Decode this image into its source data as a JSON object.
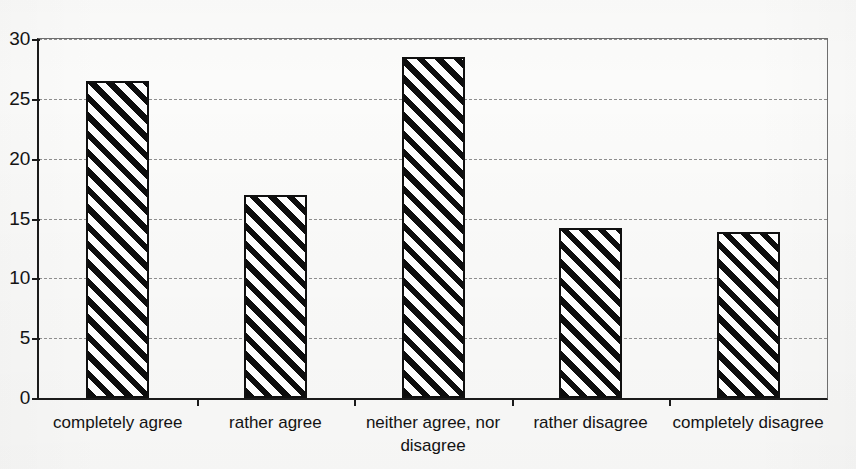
{
  "chart_data": {
    "type": "bar",
    "title": "",
    "subtitle": "",
    "xlabel": "",
    "ylabel": "",
    "categories": [
      "completely agree",
      "rather agree",
      "neither agree, nor\ndisagree",
      "rather disagree",
      "completely disagree"
    ],
    "values": [
      26.5,
      17.0,
      28.5,
      14.2,
      13.9
    ],
    "ylim": [
      0,
      30
    ],
    "ytick_values": [
      0,
      5,
      10,
      15,
      20,
      25,
      30
    ],
    "ytick_labels": [
      "0",
      "5",
      "10",
      "15",
      "20",
      "25",
      "30"
    ],
    "grid": true,
    "grid_axis": "y",
    "grid_style": "dashed",
    "legend": false,
    "legend_position": "none",
    "annotations": [],
    "bar_fill": "diagonal-hatch-black-on-white",
    "colors": {
      "bar_edge": "#101010",
      "bar_hatch": "#0d0d0d",
      "bar_background": "#ffffff",
      "axis": "#1b1b1b",
      "gridline": "#8d8d8d",
      "text": "#131313",
      "page_background": "#fbfbfa"
    }
  }
}
